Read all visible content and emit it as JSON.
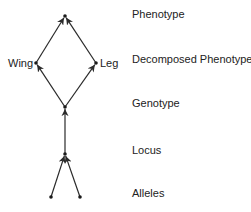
{
  "diagram": {
    "levels": [
      {
        "label": "Phenotype",
        "y": 8
      },
      {
        "label": "Decomposed Phenotype",
        "y": 53
      },
      {
        "label": "Genotype",
        "y": 97
      },
      {
        "label": "Locus",
        "y": 144
      },
      {
        "label": "Alleles",
        "y": 187
      }
    ],
    "nodes": {
      "phenotype": {
        "x": 65,
        "y": 16
      },
      "wing": {
        "x": 36,
        "y": 63,
        "label": "Wing"
      },
      "leg": {
        "x": 96,
        "y": 63,
        "label": "Leg"
      },
      "genotype": {
        "x": 65,
        "y": 107
      },
      "locus": {
        "x": 65,
        "y": 154
      },
      "allele_1": {
        "x": 51,
        "y": 197
      },
      "allele_2": {
        "x": 80,
        "y": 197
      }
    },
    "edges": [
      {
        "from": "allele_1",
        "to": "locus"
      },
      {
        "from": "allele_2",
        "to": "locus"
      },
      {
        "from": "locus",
        "to": "genotype"
      },
      {
        "from": "genotype",
        "to": "wing"
      },
      {
        "from": "genotype",
        "to": "leg"
      },
      {
        "from": "wing",
        "to": "phenotype"
      },
      {
        "from": "leg",
        "to": "phenotype"
      }
    ],
    "colors": {
      "line": "#2a2a2a",
      "node": "#1a1a1a",
      "text": "#222222"
    }
  }
}
